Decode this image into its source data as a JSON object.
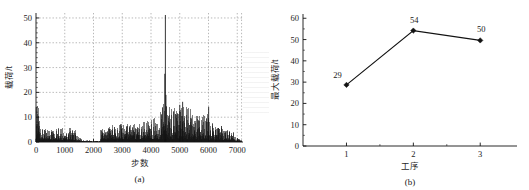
{
  "figure": {
    "background_color": "#ffffff",
    "ink_color": "#121212",
    "grid_color": "#9a9a9a"
  },
  "panel_a": {
    "caption": "(a)",
    "chart_data": {
      "type": "line",
      "title": "",
      "subtitle": "",
      "xlabel": "步数",
      "ylabel": "载荷/t",
      "xlim": [
        0,
        7200
      ],
      "ylim": [
        0,
        52
      ],
      "xticks": [
        0,
        1000,
        2000,
        3000,
        4000,
        5000,
        6000,
        7000
      ],
      "yticks": [
        0,
        10,
        20,
        30,
        40,
        50
      ],
      "xtick_labels": [
        "0",
        "1000",
        "2000",
        "3000",
        "4000",
        "5000",
        "6000",
        "7000"
      ],
      "ytick_labels": [
        "0",
        "10",
        "20",
        "30",
        "40",
        "50"
      ],
      "grid": true,
      "grid_style": "dotted",
      "legend": "none",
      "minor_ticks": true,
      "annotations": [
        {
          "text": "peak spike near step 4500 reaching about 51 t"
        },
        {
          "text": "quiet interval between about step 1600 and step 2250"
        }
      ],
      "series": [
        {
          "name": "载荷",
          "color": "#121212",
          "description": "Dense high-frequency load signal plotted against step number.",
          "segments": [
            {
              "x_start": 0,
              "x_end": 120,
              "baseline": 1.2,
              "amplitude": 13.5,
              "note": "initial burst to ~14 t"
            },
            {
              "x_start": 120,
              "x_end": 700,
              "baseline": 0.9,
              "amplitude": 6.5,
              "note": "decaying dense noise"
            },
            {
              "x_start": 700,
              "x_end": 1400,
              "baseline": 0.7,
              "amplitude": 5.0,
              "note": "moderate dense noise"
            },
            {
              "x_start": 1400,
              "x_end": 1600,
              "baseline": 0.5,
              "amplitude": 2.4,
              "note": "tapering off"
            },
            {
              "x_start": 1600,
              "x_end": 2250,
              "baseline": 0.15,
              "amplitude": 0.5,
              "note": "near-zero quiet gap"
            },
            {
              "x_start": 2250,
              "x_end": 3200,
              "baseline": 1.0,
              "amplitude": 6.8,
              "note": "activity resumes"
            },
            {
              "x_start": 3200,
              "x_end": 4300,
              "baseline": 1.0,
              "amplitude": 8.0,
              "note": "rising dense band"
            },
            {
              "x_start": 4300,
              "x_end": 4600,
              "baseline": 1.2,
              "amplitude": 16.0,
              "note": "spike cluster, max ~51 t"
            },
            {
              "x_start": 4600,
              "x_end": 5400,
              "baseline": 1.2,
              "amplitude": 13.0,
              "note": "high plateau ~10-16 t"
            },
            {
              "x_start": 5400,
              "x_end": 6100,
              "baseline": 1.0,
              "amplitude": 10.5,
              "note": "sustained band with spike ~14 t at 6000"
            },
            {
              "x_start": 6100,
              "x_end": 6900,
              "baseline": 0.8,
              "amplitude": 7.5,
              "note": "declining band"
            },
            {
              "x_start": 6900,
              "x_end": 7150,
              "baseline": 0.4,
              "amplitude": 2.0,
              "note": "fade to zero"
            }
          ]
        }
      ]
    }
  },
  "panel_b": {
    "caption": "(b)",
    "chart_data": {
      "type": "line",
      "title": "",
      "subtitle": "",
      "xlabel": "工序",
      "ylabel": "最大载荷/t",
      "xlim": [
        0.35,
        3.55
      ],
      "ylim": [
        0,
        62
      ],
      "xticks": [
        1,
        2,
        3
      ],
      "yticks": [
        0,
        10,
        20,
        30,
        40,
        50,
        60
      ],
      "xtick_labels": [
        "1",
        "2",
        "3"
      ],
      "ytick_labels": [
        "0",
        "10",
        "20",
        "30",
        "40",
        "50",
        "60"
      ],
      "grid": false,
      "legend": "none",
      "marker": "diamond",
      "marker_color": "#121212",
      "line_color": "#121212",
      "categories": [
        "1",
        "2",
        "3"
      ],
      "values": [
        28.7,
        54.2,
        49.6
      ],
      "data_labels": [
        "29",
        "54",
        "50"
      ],
      "series": [
        {
          "name": "最大载荷",
          "color": "#121212",
          "values": [
            28.7,
            54.2,
            49.6
          ]
        }
      ]
    }
  }
}
